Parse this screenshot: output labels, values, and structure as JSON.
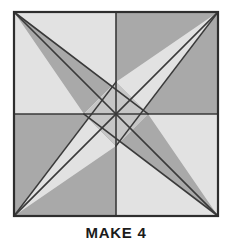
{
  "figure": {
    "name": "quilt-block-diagram",
    "kind": "pinwheel-star-quilt-block",
    "caption": "MAKE 4",
    "colors": {
      "background": "#ffffff",
      "light_fabric": "#e2e2e2",
      "dark_fabric": "#a9a9a9",
      "line": "#3a3a3a",
      "border": "#2e2e2e",
      "caption_text": "#1b1b1b"
    },
    "geometry": {
      "square": {
        "x": 14,
        "y": 12,
        "size": 204
      },
      "center": {
        "x": 116,
        "y": 114
      },
      "center_diamond_radius": 32,
      "quadrants": [
        "top-left",
        "top-right",
        "bottom-left",
        "bottom-right"
      ],
      "line_width": 1.6,
      "border_width": 2.2
    },
    "patches": [
      {
        "name": "tl-background-light",
        "fill": "light_fabric",
        "points": "14,12 116,12 116,114 14,114"
      },
      {
        "name": "tl-dark-kite",
        "fill": "dark_fabric",
        "points": "14,12 148,114 116,82 84,114"
      },
      {
        "name": "tr-background-dark",
        "fill": "dark_fabric",
        "points": "116,12 218,12 218,114 116,114"
      },
      {
        "name": "tr-light-kite",
        "fill": "light_fabric",
        "points": "218,12 116,146 148,114 116,82"
      },
      {
        "name": "bl-background-dark",
        "fill": "dark_fabric",
        "points": "14,114 116,114 116,216 14,216"
      },
      {
        "name": "bl-light-kite",
        "fill": "light_fabric",
        "points": "14,216 116,82 84,114 116,146"
      },
      {
        "name": "br-background-light",
        "fill": "light_fabric",
        "points": "116,114 218,114 218,216 116,216"
      },
      {
        "name": "br-dark-kite",
        "fill": "dark_fabric",
        "points": "218,216 84,114 116,146 148,114"
      }
    ],
    "seam_lines": [
      {
        "name": "vertical-center-seam",
        "x1": 116,
        "y1": 12,
        "x2": 116,
        "y2": 216
      },
      {
        "name": "horizontal-center-seam",
        "x1": 14,
        "y1": 114,
        "x2": 218,
        "y2": 114
      },
      {
        "name": "diagonal-tl-to-br",
        "x1": 14,
        "y1": 12,
        "x2": 218,
        "y2": 216
      },
      {
        "name": "diagonal-tr-to-bl",
        "x1": 218,
        "y1": 12,
        "x2": 14,
        "y2": 216
      },
      {
        "name": "spoke-tl-to-right-vertex",
        "x1": 14,
        "y1": 12,
        "x2": 148,
        "y2": 114
      },
      {
        "name": "spoke-tr-to-bottom-vertex",
        "x1": 218,
        "y1": 12,
        "x2": 116,
        "y2": 146
      },
      {
        "name": "spoke-bl-to-top-vertex",
        "x1": 14,
        "y1": 216,
        "x2": 116,
        "y2": 82
      },
      {
        "name": "spoke-br-to-left-vertex",
        "x1": 218,
        "y1": 216,
        "x2": 84,
        "y2": 114
      }
    ]
  }
}
